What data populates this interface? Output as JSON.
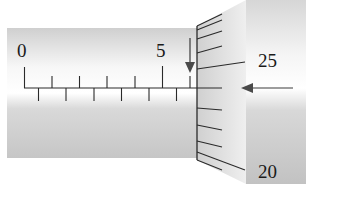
{
  "diagram": {
    "sleeve": {
      "labels": [
        "0",
        "5"
      ],
      "main_scale_divisions_mm": 1,
      "half_mm_ticks": true,
      "upper_tick_count": 7,
      "lower_tick_count": 6
    },
    "thimble": {
      "labels": [
        "25",
        "20"
      ],
      "tick_count_visible": 10
    },
    "indicators": {
      "down_arrow": "down-arrow-icon",
      "left_arrow": "left-arrow-icon"
    },
    "colors": {
      "background": "#ffffff",
      "sleeve_light": "#f4f4f4",
      "sleeve_dark": "#c8c8c8",
      "thimble_light": "#f6f6f6",
      "thimble_dark": "#c4c4c4",
      "ink": "#2a2a2a"
    }
  }
}
